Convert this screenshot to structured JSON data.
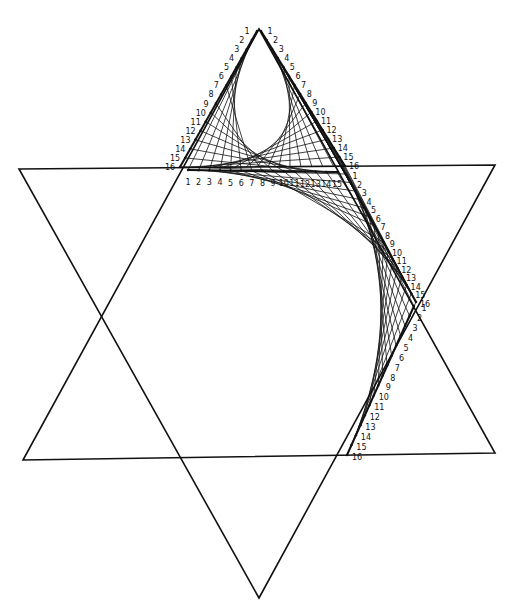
{
  "diagram": {
    "type": "string-art",
    "stroke_color": "#111111",
    "background": "#ffffff",
    "star": {
      "triangle_up": [
        [
          259,
          29
        ],
        [
          23,
          460
        ],
        [
          495,
          453
        ]
      ],
      "triangle_down": [
        [
          19,
          169
        ],
        [
          495,
          165
        ],
        [
          259,
          598
        ]
      ]
    },
    "segments": [
      {
        "id": "top-left-edge",
        "from": [
          257,
          31
        ],
        "to": [
          180,
          167
        ],
        "count": 16,
        "labels": [
          "1",
          "2",
          "3",
          "4",
          "5",
          "6",
          "7",
          "8",
          "9",
          "10",
          "11",
          "12",
          "13",
          "14",
          "15",
          "16"
        ],
        "label_offset": [
          -10,
          0
        ]
      },
      {
        "id": "top-right-edge",
        "from": [
          261,
          31
        ],
        "to": [
          345,
          166
        ],
        "count": 16,
        "labels": [
          "1",
          "2",
          "3",
          "4",
          "5",
          "6",
          "7",
          "8",
          "9",
          "10",
          "11",
          "12",
          "13",
          "14",
          "15",
          "16"
        ],
        "label_offset": [
          9,
          0
        ]
      },
      {
        "id": "base-line",
        "from": [
          188,
          170
        ],
        "to": [
          337,
          172
        ],
        "count": 15,
        "labels": [
          "1",
          "2",
          "3",
          "4",
          "5",
          "6",
          "7",
          "8",
          "9",
          "10",
          "11",
          "12",
          "13",
          "14",
          "15"
        ],
        "label_offset": [
          0,
          12
        ]
      },
      {
        "id": "right-upper-diagonal",
        "from": [
          346,
          174
        ],
        "to": [
          416,
          302
        ],
        "count": 16,
        "labels": [
          "1",
          "2",
          "3",
          "4",
          "5",
          "6",
          "7",
          "8",
          "9",
          "10",
          "11",
          "12",
          "13",
          "14",
          "15",
          "16"
        ],
        "label_offset": [
          9,
          2
        ]
      },
      {
        "id": "right-lower-diagonal",
        "from": [
          414,
          306
        ],
        "to": [
          347,
          455
        ],
        "count": 16,
        "labels": [
          "1",
          "2",
          "3",
          "4",
          "5",
          "6",
          "7",
          "8",
          "9",
          "10",
          "11",
          "12",
          "13",
          "14",
          "15",
          "16"
        ],
        "label_offset": [
          10,
          2
        ]
      }
    ],
    "string_groups": [
      {
        "a": "top-left-edge",
        "b": "base-line",
        "rule": "i-to-i"
      },
      {
        "a": "top-right-edge",
        "b": "right-upper-diagonal",
        "rule": "i-to-i"
      },
      {
        "a": "base-line",
        "b": "right-upper-diagonal",
        "rule": "i-to-i"
      },
      {
        "a": "top-left-edge",
        "b": "top-right-edge",
        "rule": "i-to-rev"
      },
      {
        "a": "right-upper-diagonal",
        "b": "right-lower-diagonal",
        "rule": "i-to-i"
      }
    ]
  }
}
